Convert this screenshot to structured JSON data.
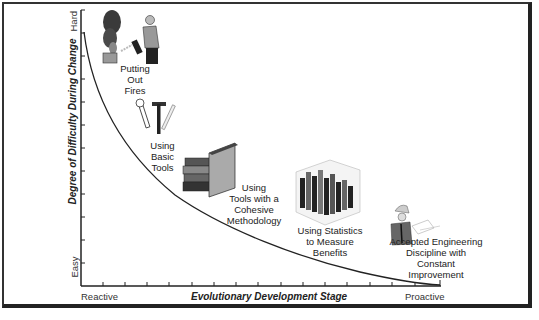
{
  "figure": {
    "y_axis": {
      "title": "Degree of Difficulty During Change",
      "top_label": "Hard",
      "bottom_label": "Easy",
      "tick_count": 12
    },
    "x_axis": {
      "title": "Evolutionary Development Stage",
      "left_label": "Reactive",
      "right_label": "Proactive",
      "tick_count": 16
    },
    "stages": [
      {
        "label_lines": [
          "Putting",
          "Out",
          "Fires"
        ],
        "icon": "firefighter-icon"
      },
      {
        "label_lines": [
          "Using",
          "Basic",
          "Tools"
        ],
        "icon": "tools-icon"
      },
      {
        "label_lines": [
          "Using",
          "Tools with a",
          "Cohesive",
          "Methodology"
        ],
        "icon": "books-icon"
      },
      {
        "label_lines": [
          "Using Statistics",
          "to Measure",
          "Benefits"
        ],
        "icon": "3d-bar-chart-icon"
      },
      {
        "label_lines": [
          "Accepted Engineering",
          "Discipline with",
          "Constant",
          "Improvement"
        ],
        "icon": "engineer-icon"
      }
    ],
    "curve": {
      "description": "decreasing convex curve from Hard/Reactive to Easy/Proactive",
      "color": "#222222"
    }
  }
}
